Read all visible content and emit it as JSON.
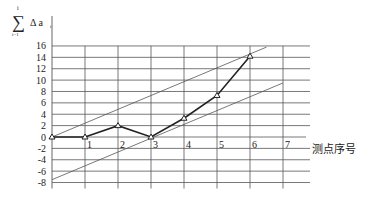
{
  "chart_data": {
    "type": "line",
    "title": "",
    "xlabel": "测点序号",
    "ylabel_parts": {
      "sum_top": "i",
      "sum_bottom": "i=1",
      "symbol": "Δ a",
      "subscript": "i"
    },
    "x_ticks": [
      "1",
      "2",
      "3",
      "4",
      "5",
      "6",
      "7"
    ],
    "y_ticks": [
      "16",
      "14",
      "12",
      "10",
      "8",
      "6",
      "4",
      "2",
      "0",
      "-2",
      "-4",
      "-6",
      "-8"
    ],
    "xlim": [
      0,
      7.8
    ],
    "ylim": [
      -8,
      16
    ],
    "grid": true,
    "series": [
      {
        "name": "cumulative deviation",
        "marker": "triangle",
        "x": [
          0,
          1,
          2,
          3,
          4,
          5,
          6
        ],
        "values": [
          0,
          0,
          2,
          0,
          3.3,
          7.3,
          14.2
        ]
      }
    ],
    "envelope_lines": [
      {
        "name": "upper envelope",
        "x": [
          0,
          6.5
        ],
        "values": [
          0,
          15.8
        ]
      },
      {
        "name": "lower envelope",
        "x": [
          0,
          7
        ],
        "values": [
          -7.5,
          9.5
        ]
      }
    ]
  },
  "colors": {
    "grid": "#555555",
    "line": "#222222",
    "envelope": "#555555"
  }
}
